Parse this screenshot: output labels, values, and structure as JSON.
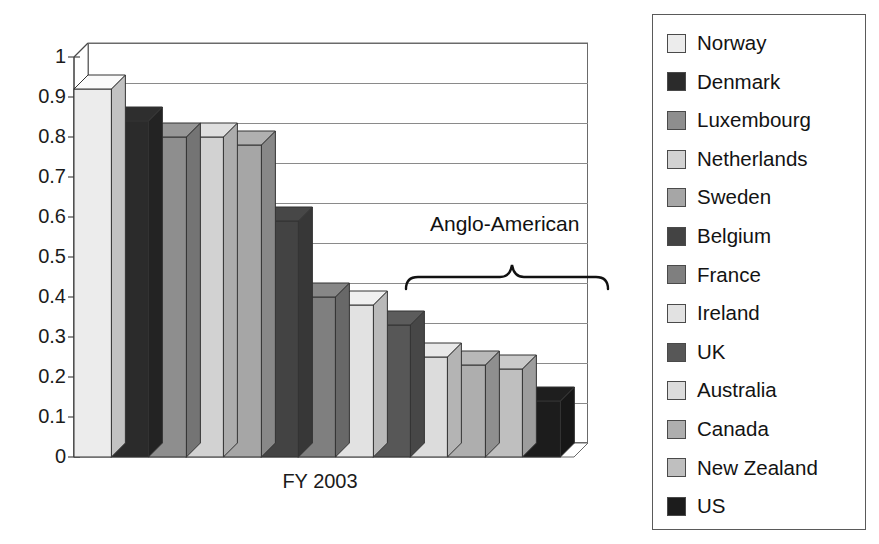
{
  "chart_data": {
    "type": "bar",
    "title": "",
    "xlabel": "FY 2003",
    "ylabel": "",
    "ylim": [
      0,
      1
    ],
    "ytick_labels": [
      "1",
      "0.9",
      "0.8",
      "0.7",
      "0.6",
      "0.5",
      "0.4",
      "0.3",
      "0.2",
      "0.1",
      "0"
    ],
    "ytick_values": [
      1,
      0.9,
      0.8,
      0.7,
      0.6,
      0.5,
      0.4,
      0.3,
      0.2,
      0.1,
      0
    ],
    "grid": true,
    "legend_position": "right",
    "categories": [
      "Norway",
      "Denmark",
      "Luxembourg",
      "Netherlands",
      "Sweden",
      "Belgium",
      "France",
      "Ireland",
      "UK",
      "Australia",
      "Canada",
      "New Zealand",
      "US"
    ],
    "values": [
      0.92,
      0.84,
      0.8,
      0.8,
      0.78,
      0.59,
      0.4,
      0.38,
      0.33,
      0.25,
      0.23,
      0.22,
      0.14
    ],
    "colors": [
      "#ececec",
      "#2b2b2b",
      "#8e8e8e",
      "#d2d2d2",
      "#a6a6a6",
      "#434343",
      "#7f7f7f",
      "#e2e2e2",
      "#575757",
      "#dcdcdc",
      "#aeaeae",
      "#bfbfbf",
      "#1c1c1c"
    ],
    "annotations": [
      {
        "label": "Anglo-American",
        "covers": [
          "Ireland",
          "UK",
          "Australia",
          "Canada",
          "New Zealand",
          "US"
        ]
      }
    ]
  },
  "legend": {
    "items": [
      {
        "label": "Norway",
        "color": "#ececec"
      },
      {
        "label": "Denmark",
        "color": "#2b2b2b"
      },
      {
        "label": "Luxembourg",
        "color": "#8e8e8e"
      },
      {
        "label": "Netherlands",
        "color": "#d2d2d2"
      },
      {
        "label": "Sweden",
        "color": "#a6a6a6"
      },
      {
        "label": "Belgium",
        "color": "#434343"
      },
      {
        "label": "France",
        "color": "#7f7f7f"
      },
      {
        "label": "Ireland",
        "color": "#e2e2e2"
      },
      {
        "label": "UK",
        "color": "#575757"
      },
      {
        "label": "Australia",
        "color": "#dcdcdc"
      },
      {
        "label": "Canada",
        "color": "#aeaeae"
      },
      {
        "label": "New Zealand",
        "color": "#bfbfbf"
      },
      {
        "label": "US",
        "color": "#1c1c1c"
      }
    ]
  },
  "axis": {
    "x_label": "FY 2003"
  },
  "annotation": {
    "anglo_american": "Anglo-American"
  }
}
